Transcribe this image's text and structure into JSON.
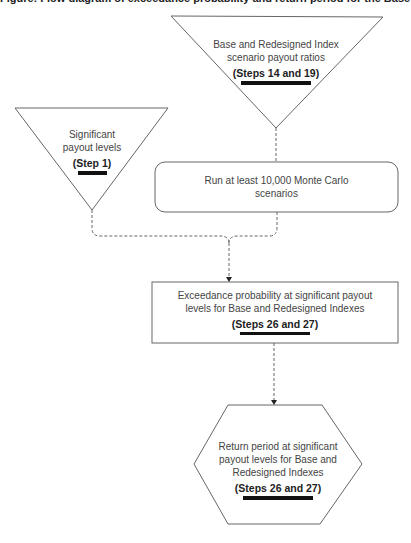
{
  "header": {
    "title": "Figure: Flow diagram of exceedance probability and return period for the Base and Redesigned Indexes"
  },
  "nodes": {
    "scenario_payouts": {
      "shape": "inverted-triangle",
      "line1": "Base and Redesigned Index",
      "line2": "scenario payout ratios",
      "step": "(Steps 14 and 19)"
    },
    "significant_levels": {
      "shape": "inverted-triangle",
      "line1": "Significant",
      "line2": "payout levels",
      "step": "(Step 1)"
    },
    "monte_carlo": {
      "shape": "rounded-rectangle",
      "line1": "Run at least 10,000 Monte Carlo",
      "line2": "scenarios"
    },
    "exceedance": {
      "shape": "rectangle",
      "line1": "Exceedance probability at significant payout",
      "line2": "levels for Base and Redesigned Indexes",
      "step": "(Steps 26 and 27)"
    },
    "return_period": {
      "shape": "hexagon",
      "line1": "Return period at significant",
      "line2": "payout levels for Base and",
      "line3": "Redesigned Indexes",
      "step": "(Steps 26 and 27)"
    }
  },
  "edges": [
    {
      "from": "scenario_payouts",
      "to": "monte_carlo",
      "style": "dashed"
    },
    {
      "from": "significant_levels",
      "to": "exceedance",
      "style": "dashed"
    },
    {
      "from": "monte_carlo",
      "to": "exceedance",
      "style": "dashed"
    },
    {
      "from": "exceedance",
      "to": "return_period",
      "style": "dashed"
    }
  ],
  "colors": {
    "stroke": "#555555",
    "text": "#444444",
    "underline": "#111111"
  }
}
